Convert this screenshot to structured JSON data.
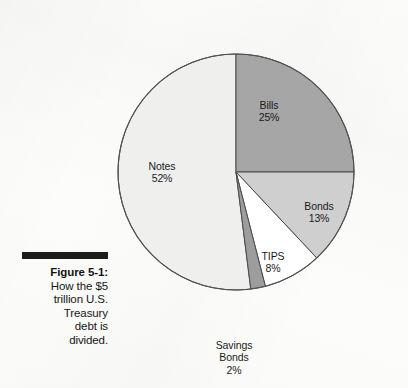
{
  "figure": {
    "caption_title": "Figure 5-1:",
    "caption_lines": [
      "How the $5",
      "trillion U.S.",
      "Treasury",
      "debt is",
      "divided."
    ]
  },
  "chart_data": {
    "type": "pie",
    "title": "How the $5 trillion U.S. Treasury debt is divided.",
    "categories": [
      "Bills",
      "Bonds",
      "TIPS",
      "Savings Bonds",
      "Notes"
    ],
    "values": [
      25,
      13,
      8,
      2,
      52
    ],
    "value_suffix": "%",
    "units": "percent of total U.S. Treasury debt",
    "total": 100,
    "start_angle_deg": 0,
    "direction": "clockwise",
    "legend": "none",
    "labels_inline": true,
    "slices": [
      {
        "name": "Bills",
        "value": 25,
        "label": "Bills",
        "value_label": "25%",
        "color": "#a6a6a6",
        "start_deg": 0,
        "end_deg": 90
      },
      {
        "name": "Bonds",
        "value": 13,
        "label": "Bonds",
        "value_label": "13%",
        "color": "#cfcfcf",
        "start_deg": 90,
        "end_deg": 136.8
      },
      {
        "name": "TIPS",
        "value": 8,
        "label": "TIPS",
        "value_label": "8%",
        "color": "#ffffff",
        "start_deg": 136.8,
        "end_deg": 165.6
      },
      {
        "name": "Savings Bonds",
        "value": 2,
        "label_line1": "Savings",
        "label_line2": "Bonds",
        "value_label": "2%",
        "color": "#9d9d9d",
        "start_deg": 165.6,
        "end_deg": 172.8
      },
      {
        "name": "Notes",
        "value": 52,
        "label": "Notes",
        "value_label": "52%",
        "color": "#efefee",
        "start_deg": 172.8,
        "end_deg": 360
      }
    ],
    "geometry": {
      "center_x": 236,
      "center_y": 172,
      "radius": 118,
      "stroke_color": "#4a4a4a",
      "stroke_width": 1
    },
    "background_color": "#fcfcfb"
  }
}
